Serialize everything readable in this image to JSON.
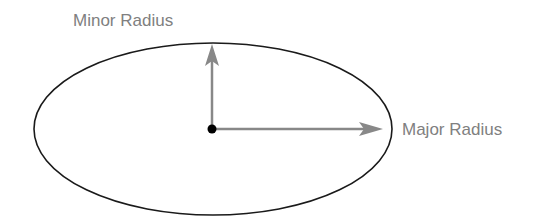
{
  "diagram": {
    "labels": {
      "minor_radius": "Minor Radius",
      "major_radius": "Major Radius"
    },
    "colors": {
      "ellipse_stroke": "#1a1a1a",
      "arrow": "#888888",
      "label_text": "#808080",
      "center_dot": "#000000"
    },
    "shapes": {
      "ellipse": {
        "cx": 213,
        "cy": 129,
        "rx": 179,
        "ry": 86
      },
      "center": {
        "x": 212,
        "y": 129
      }
    }
  }
}
